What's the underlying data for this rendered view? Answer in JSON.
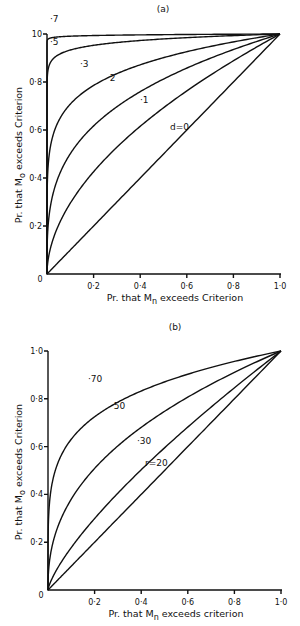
{
  "chart_data": [
    {
      "type": "line",
      "panel": "(a)",
      "xlabel": "Pr. that Mn exceeds Criterion",
      "ylabel": "Pr. that Mo exceeds Criterion",
      "xlim": [
        0,
        1.0
      ],
      "ylim": [
        0,
        1.0
      ],
      "xticks": [
        "0",
        "0·2",
        "0·4",
        "0·6",
        "0·8",
        "1·0"
      ],
      "yticks": [
        "0",
        "0·2",
        "0·4",
        "0·6",
        "0·8",
        "1·0"
      ],
      "grid": false,
      "series": [
        {
          "name": "d=0",
          "label": "d=0",
          "exponent": 1.0
        },
        {
          "name": "·1",
          "label": "·1",
          "exponent": 0.53
        },
        {
          "name": "·2",
          "label": "·2",
          "exponent": 0.3
        },
        {
          "name": "·3",
          "label": "·3",
          "exponent": 0.15
        },
        {
          "name": "·5",
          "label": "·5",
          "exponent": 0.03
        },
        {
          "name": "·7",
          "label": "·7",
          "exponent": 0.004
        }
      ]
    },
    {
      "type": "line",
      "panel": "(b)",
      "xlabel": "Pr. that Mn exceeds criterion",
      "ylabel": "Pr. that Mo exceeds Criterion",
      "xlim": [
        0,
        1.0
      ],
      "ylim": [
        0,
        1.0
      ],
      "xticks": [
        "0",
        "0·2",
        "0·4",
        "0·6",
        "0·8",
        "1·0"
      ],
      "yticks": [
        "0",
        "0·2",
        "0·4",
        "0·6",
        "0·8",
        "1·0"
      ],
      "grid": false,
      "series": [
        {
          "name": "r=20",
          "label": "r=20",
          "exponent": 1.0
        },
        {
          "name": "·30",
          "label": "·30",
          "exponent": 0.75
        },
        {
          "name": "·50",
          "label": "·50",
          "exponent": 0.42
        },
        {
          "name": "·70",
          "label": "·70",
          "exponent": 0.2
        }
      ]
    }
  ],
  "panels": {
    "a": {
      "title": "(a)",
      "xlabel_pre": "Pr. that M",
      "xlabel_sub": "n",
      "xlabel_post": " exceeds Criterion",
      "ylabel_pre": "Pr. that M",
      "ylabel_sub": "o",
      "ylabel_post": " exceeds Criterion",
      "labels": {
        "d0": "d=0",
        "c1": "·1",
        "c2": "·2",
        "c3": "·3",
        "c5": "·5",
        "c7": "·7"
      }
    },
    "b": {
      "title": "(b)",
      "xlabel_pre": "Pr. that M",
      "xlabel_sub": "n",
      "xlabel_post": " exceeds criterion",
      "ylabel_pre": "Pr. that M",
      "ylabel_sub": "o",
      "ylabel_post": " exceeds Criterion",
      "labels": {
        "r20": "r=20",
        "c30": "·30",
        "c50": "·50",
        "c70": "·70"
      }
    },
    "ticks": {
      "t0": "0",
      "t2": "0·2",
      "t4": "0·4",
      "t6": "0·6",
      "t8": "0·8",
      "t10": "1·0",
      "t10a": "10"
    }
  }
}
